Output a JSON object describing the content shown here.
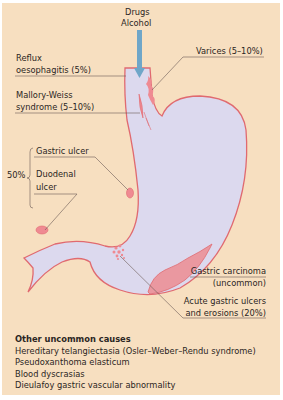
{
  "diagram": {
    "colors": {
      "background": "#f7dfc0",
      "stomach_fill": "#dcd9ee",
      "stomach_outline": "#e06a70",
      "lesion_fill": "#ef8a92",
      "carcinoma_fill": "#ea98a0",
      "arrow": "#6fa6c8",
      "leader_line": "#6b5a55",
      "text": "#2b2623"
    },
    "arrow_label": [
      "Drugs",
      "Alcohol"
    ],
    "labels": {
      "reflux": [
        "Reflux",
        "oesophagitis (5%)"
      ],
      "varices": "Varices (5–10%)",
      "mallory": [
        "Mallory-Weiss",
        "syndrome (5–10%)"
      ],
      "brace_percent": "50%",
      "gastric_ulcer": "Gastric ulcer",
      "duodenal": [
        "Duodenal",
        "ulcer"
      ],
      "carcinoma": [
        "Gastric carcinoma",
        "(uncommon)"
      ],
      "acute": [
        "Acute gastric ulcers",
        "and erosions (20%)"
      ]
    },
    "other_causes": {
      "heading": "Other uncommon causes",
      "items": [
        "Hereditary telangiectasia (Osler–Weber–Rendu syndrome)",
        "Pseudoxanthoma elasticum",
        "Blood dyscrasias",
        "Dieulafoy gastric vascular abnormality"
      ]
    }
  }
}
